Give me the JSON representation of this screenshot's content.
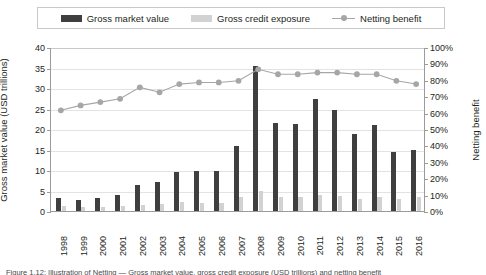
{
  "legend": {
    "items": [
      {
        "label": "Gross market value",
        "marker": "bar-swatch",
        "color": "#3f3f3f"
      },
      {
        "label": "Gross credit exposure",
        "marker": "bar-swatch",
        "color": "#d2d2d2"
      },
      {
        "label": "Netting benefit",
        "marker": "line-marker-swatch",
        "color": "#a6a6a6"
      }
    ]
  },
  "axes": {
    "left_title": "Gross market value (USD trillions)",
    "right_title": "Netting benefit",
    "left_ticks": [
      "0",
      "5",
      "10",
      "15",
      "20",
      "25",
      "30",
      "35",
      "40"
    ],
    "right_ticks": [
      "0%",
      "10%",
      "20%",
      "30%",
      "40%",
      "50%",
      "60%",
      "70%",
      "80%",
      "90%",
      "100%"
    ]
  },
  "caption": {
    "text": "Figure 1.12: Illustration of  Netting  — Gross market value, gross credit exposure (USD trillions) and netting benefit"
  },
  "chart_data": {
    "type": "bar",
    "title": "",
    "subtitle": "",
    "xlabel": "",
    "ylabel": "Gross market value (USD trillions)",
    "y2label": "Netting benefit",
    "ylim": [
      0,
      40
    ],
    "y2lim": [
      0,
      100
    ],
    "grid": true,
    "legend_position": "top",
    "categories": [
      "1998",
      "1999",
      "2000",
      "2001",
      "2002",
      "2003",
      "2004",
      "2005",
      "2006",
      "2007",
      "2008",
      "2009",
      "2010",
      "2011",
      "2012",
      "2013",
      "2014",
      "2015",
      "2016"
    ],
    "series": [
      {
        "name": "Gross market value",
        "type": "bar",
        "axis": "left",
        "unit": "USD trillions",
        "color": "#3f3f3f",
        "values": [
          3.2,
          2.8,
          3.2,
          3.8,
          6.4,
          7.0,
          9.4,
          9.8,
          9.7,
          15.8,
          35.3,
          21.5,
          21.3,
          27.3,
          24.7,
          18.7,
          20.9,
          14.5,
          15.0
        ]
      },
      {
        "name": "Gross credit exposure",
        "type": "bar",
        "axis": "left",
        "unit": "USD trillions",
        "color": "#d2d2d2",
        "values": [
          1.2,
          1.0,
          1.1,
          1.2,
          1.5,
          1.8,
          2.1,
          2.0,
          2.0,
          3.3,
          5.0,
          3.5,
          3.5,
          3.9,
          3.6,
          3.0,
          3.4,
          2.9,
          3.3
        ]
      },
      {
        "name": "Netting benefit",
        "type": "line",
        "axis": "right",
        "unit": "%",
        "color": "#a6a6a6",
        "values": [
          62,
          65,
          67,
          69,
          76,
          73,
          78,
          79,
          79,
          80,
          87,
          84,
          84,
          85,
          85,
          84,
          84,
          80,
          78
        ]
      }
    ]
  }
}
